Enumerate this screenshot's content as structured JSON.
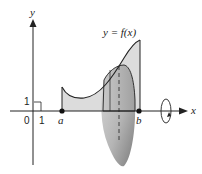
{
  "diagram": {
    "axes": {
      "x_label": "x",
      "y_label": "y",
      "origin_label": "0",
      "x_unit_label": "1",
      "y_unit_label": "1"
    },
    "points": {
      "a_label": "a",
      "b_label": "b"
    },
    "curve_label": "y = f(x)",
    "colors": {
      "line": "#222222",
      "region_fill": "#d9d9d9",
      "solid_fill_light": "#e8e8e8",
      "solid_fill_dark": "#8a8a8a"
    },
    "icons": {
      "rotation": "rotation-arrow-icon"
    }
  }
}
